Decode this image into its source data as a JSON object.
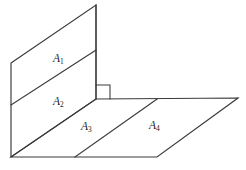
{
  "figure": {
    "kind": "geometry-diagram",
    "background_color": "#ffffff",
    "line_color": "#3a3a3a",
    "label_color": "#1d1d1d",
    "canvas": {
      "width": 246,
      "height": 170
    },
    "vertical_plane": {
      "name": "wall",
      "outline": "11,63 96,5 96,99 11,157",
      "regions": [
        {
          "id": "A1",
          "label_base": "A",
          "label_sub": "1",
          "label_x": 53,
          "label_y": 62
        },
        {
          "id": "A2",
          "label_base": "A",
          "label_sub": "2",
          "label_x": 53,
          "label_y": 105
        }
      ],
      "divider": "11,105 96,50"
    },
    "horizontal_plane": {
      "name": "floor",
      "outline": "96,99 238,98 157,157 11,157",
      "regions": [
        {
          "id": "A3",
          "label_base": "A",
          "label_sub": "3",
          "label_x": 81,
          "label_y": 130
        },
        {
          "id": "A4",
          "label_base": "A",
          "label_sub": "4",
          "label_x": 149,
          "label_y": 129
        }
      ],
      "divider": "75,157 157,99"
    },
    "shared_edge": "96,5 96,99",
    "right_angle_marker": {
      "name": "right-angle-square",
      "path": "96,85 110,85 110,99",
      "size": 14,
      "meaning": "planes are perpendicular"
    }
  }
}
